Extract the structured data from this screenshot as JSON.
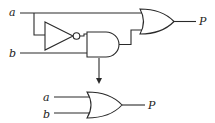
{
  "diagram": {
    "type": "logic-circuit-simplification",
    "top_circuit": {
      "inputs": [
        {
          "label": "a"
        },
        {
          "label": "b"
        }
      ],
      "gates": [
        {
          "type": "NOT",
          "input": "a"
        },
        {
          "type": "AND",
          "inputs": [
            "NOT a",
            "b"
          ]
        },
        {
          "type": "OR",
          "inputs": [
            "a",
            "AND output"
          ]
        }
      ],
      "output": {
        "label": "P"
      }
    },
    "arrow": {
      "direction": "down"
    },
    "bottom_circuit": {
      "inputs": [
        {
          "label": "a"
        },
        {
          "label": "b"
        }
      ],
      "gates": [
        {
          "type": "OR",
          "inputs": [
            "a",
            "b"
          ]
        }
      ],
      "output": {
        "label": "P"
      }
    }
  },
  "colors": {
    "line": "#2a2a2a",
    "background": "#ffffff"
  }
}
